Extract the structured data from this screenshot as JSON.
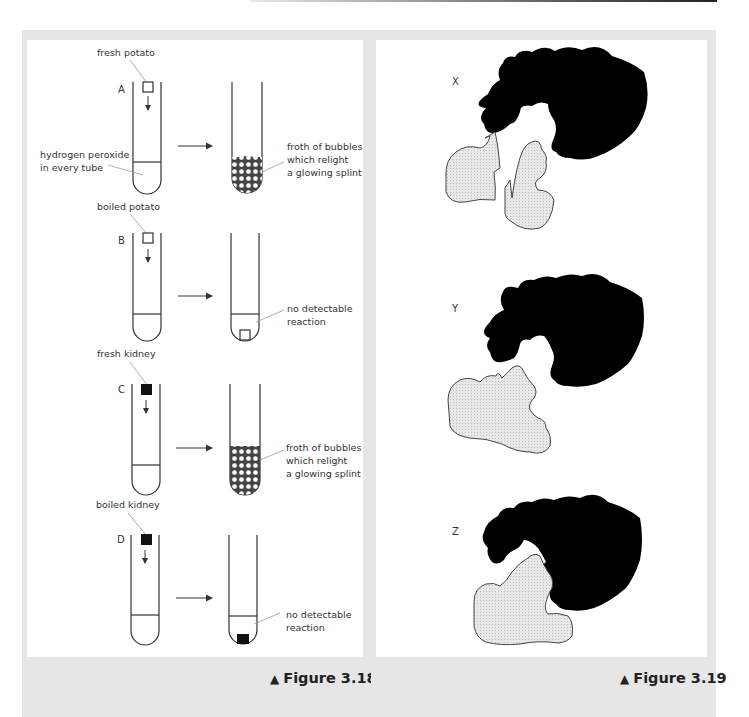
{
  "figure_318": {
    "caption": "Figure 3.18",
    "caption_marker": "▲",
    "shared_label_line1": "hydrogen peroxide",
    "shared_label_line2": "in every tube",
    "experiments": [
      {
        "letter": "A",
        "sample": "fresh potato",
        "sample_color": "#ffffff",
        "result_line1": "froth of bubbles",
        "result_line2": "which relight",
        "result_line3": "a glowing splint",
        "outcome": "froth"
      },
      {
        "letter": "B",
        "sample": "boiled potato",
        "sample_color": "#ffffff",
        "result_line1": "no detectable",
        "result_line2": "reaction",
        "result_line3": "",
        "outcome": "none"
      },
      {
        "letter": "C",
        "sample": "fresh kidney",
        "sample_color": "#111111",
        "result_line1": "froth of bubbles",
        "result_line2": "which relight",
        "result_line3": "a glowing splint",
        "outcome": "froth"
      },
      {
        "letter": "D",
        "sample": "boiled kidney",
        "sample_color": "#111111",
        "result_line1": "no detectable",
        "result_line2": "reaction",
        "result_line3": "",
        "outcome": "none"
      }
    ]
  },
  "figure_319": {
    "caption": "Figure 3.19",
    "caption_marker": "▲",
    "panels": [
      {
        "letter": "X",
        "state": "substrate split into two fragments near enzyme"
      },
      {
        "letter": "Y",
        "state": "substrate approaching enzyme active site"
      },
      {
        "letter": "Z",
        "state": "substrate bound in enzyme active site"
      }
    ],
    "enzyme_color": "#000000",
    "substrate_color": "#e4e4e4"
  },
  "colors": {
    "panel_bg": "#e6e6e6",
    "inner_bg": "#ffffff",
    "line": "#333333"
  }
}
